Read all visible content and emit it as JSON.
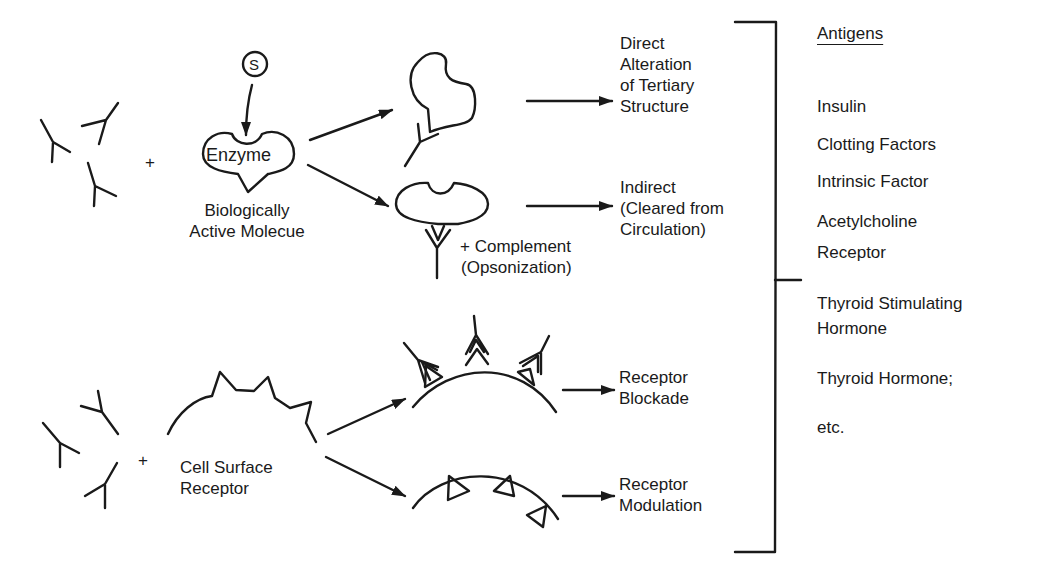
{
  "diagram": {
    "top_pathway": {
      "reactant_plus": "+",
      "substrate_symbol": "S",
      "enzyme_label": "Enzyme",
      "molecule_caption": [
        "Biologically",
        "Active Molecue"
      ],
      "complement_caption": [
        "+ Complement",
        "(Opsonization)"
      ],
      "outcomes": [
        {
          "lines": [
            "Direct",
            "Alteration",
            "of Tertiary",
            "Structure"
          ]
        },
        {
          "lines": [
            "Indirect",
            "(Cleared from",
            "Circulation)"
          ]
        }
      ]
    },
    "bottom_pathway": {
      "reactant_plus": "+",
      "receptor_caption": [
        "Cell Surface",
        "Receptor"
      ],
      "outcomes": [
        {
          "lines": [
            "Receptor",
            "Blockade"
          ]
        },
        {
          "lines": [
            "Receptor",
            "Modulation"
          ]
        }
      ]
    },
    "antigens": {
      "heading": "Antigens",
      "items": [
        "Insulin",
        "Clotting Factors",
        "Intrinsic Factor",
        "Acetylcholine",
        "Receptor",
        "Thyroid Stimulating",
        "Hormone",
        "Thyroid Hormone;",
        "etc."
      ]
    },
    "colors": {
      "ink": "#1a1a1a",
      "background": "#ffffff"
    }
  }
}
